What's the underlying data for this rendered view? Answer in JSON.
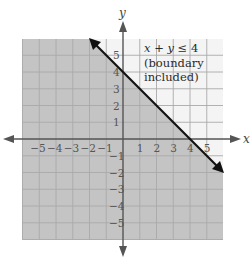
{
  "chart_data": {
    "type": "line",
    "title": "",
    "xlabel": "x",
    "ylabel": "y",
    "xlim": [
      -6,
      6
    ],
    "ylim": [
      -6,
      6
    ],
    "grid": true,
    "x_ticks": [
      -5,
      -4,
      -3,
      -2,
      -1,
      1,
      2,
      3,
      4,
      5
    ],
    "y_ticks": [
      5,
      4,
      3,
      2,
      1,
      -1,
      -2,
      -3,
      -4,
      -5
    ],
    "x_tick_labels": [
      "−5",
      "−4",
      "−3",
      "−2",
      "−1",
      "1",
      "2",
      "3",
      "4",
      "5"
    ],
    "y_tick_labels": [
      "5",
      "4",
      "3",
      "2",
      "1",
      "−1",
      "−2",
      "−3",
      "−4",
      "−5"
    ],
    "series": [
      {
        "name": "x + y = 4 (boundary)",
        "x": [
          -2,
          0,
          4,
          6
        ],
        "y": [
          6,
          4,
          0,
          -2
        ],
        "style": "solid",
        "arrows": "both"
      }
    ],
    "shaded_region": {
      "inequality": "x + y ≤ 4",
      "side": "below-left",
      "color": "#c4c4c4"
    },
    "annotations": [
      {
        "text_line1_expr": "x + y ≤ 4",
        "text_line2": "(boundary",
        "text_line3": "included)",
        "x": 1,
        "y": 5.5
      }
    ]
  },
  "labels": {
    "x_axis": "x",
    "y_axis": "y",
    "annotation": {
      "lhs_x": "x",
      "plus": " + ",
      "lhs_y": "y",
      "rel": " ≤ 4",
      "line2": "(boundary",
      "line3": "included)"
    }
  },
  "colors": {
    "shade": "#c4c4c4",
    "grid_shaded": "#a9a9a9",
    "grid_unshaded": "#cfcfcf",
    "axis": "#555555",
    "boundary": "#111111"
  }
}
